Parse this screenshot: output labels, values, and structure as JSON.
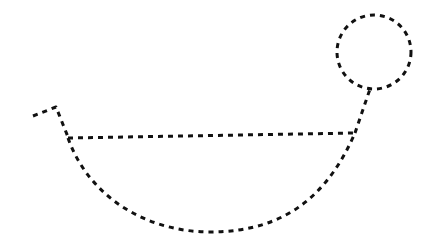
{
  "diagram": {
    "stroke_color": "#111111",
    "background_color": "#ffffff",
    "stroke_style": "dashed",
    "elements": {
      "circle": {
        "cx": 374,
        "cy": 52,
        "r": 37
      },
      "left_zigzag": {
        "points": [
          [
            33,
            116
          ],
          [
            56,
            107
          ],
          [
            68,
            137
          ]
        ]
      },
      "horizontal_line": {
        "from": [
          68,
          138
        ],
        "to": [
          355,
          133
        ]
      },
      "bottom_curve": {
        "from": [
          68,
          138
        ],
        "to": [
          355,
          133
        ],
        "lowest_point": [
          210,
          232
        ]
      },
      "stem_to_circle": {
        "from": [
          355,
          133
        ],
        "to": [
          370,
          89
        ]
      }
    }
  }
}
